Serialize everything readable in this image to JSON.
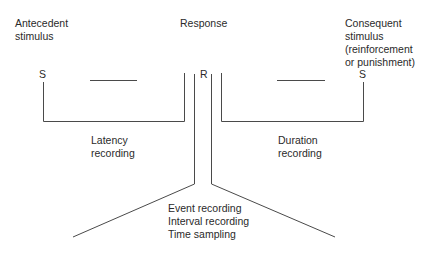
{
  "diagram": {
    "antecedent_label": "Antecedent\nstimulus",
    "response_label": "Response",
    "consequent_label": "Consequent\nstimulus\n(reinforcement\nor punishment)",
    "s_left": "S",
    "r_mid": "R",
    "s_right": "S",
    "latency_label": "Latency\nrecording",
    "duration_label": "Duration\nrecording",
    "bottom_labels": "Event recording\nInterval recording\nTime sampling"
  },
  "colors": {
    "line": "#3a3a3a",
    "text": "#2a2a2a"
  }
}
